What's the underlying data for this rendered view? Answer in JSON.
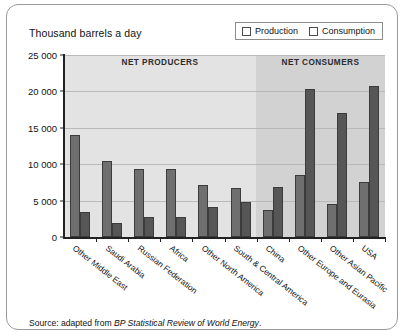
{
  "figure": {
    "title": "Thousand barrels a day",
    "source_prefix": "Source: adapted from ",
    "source_italic": "BP Statistical Review of World Energy",
    "source_suffix": "."
  },
  "legend": {
    "position": "top-right",
    "items": [
      {
        "label": "Production",
        "icon": "legend-swatch-icon",
        "color": "#6f6f6f"
      },
      {
        "label": "Consumption",
        "icon": "legend-swatch-icon",
        "color": "#565656"
      }
    ]
  },
  "bands": [
    {
      "label": "NET PRODUCERS",
      "color": "#e3e3e3"
    },
    {
      "label": "NET CONSUMERS",
      "color": "#d2d2d2"
    }
  ],
  "chart_data": {
    "type": "bar",
    "title": "Thousand barrels a day",
    "xlabel": "",
    "ylabel": "Thousand barrels a day",
    "ylim": [
      0,
      25000
    ],
    "yticks": [
      0,
      5000,
      10000,
      15000,
      20000,
      25000
    ],
    "ytick_labels": [
      "0",
      "5 000",
      "10 000",
      "15 000",
      "20 000",
      "25 000"
    ],
    "grid": true,
    "legend_position": "top-right",
    "categories": [
      "Other Middle East",
      "Saudi Arabia",
      "Russian Federation",
      "Africa",
      "Other North America",
      "South & Central America",
      "China",
      "Other Europe and Eurasia",
      "Other Asian Pacific",
      "USA"
    ],
    "series": [
      {
        "name": "Production",
        "color": "#6f6f6f",
        "values": [
          14000,
          10500,
          9400,
          9400,
          7100,
          6800,
          3700,
          8500,
          4600,
          7500
        ]
      },
      {
        "name": "Consumption",
        "color": "#565656",
        "values": [
          3500,
          1900,
          2700,
          2800,
          4100,
          4800,
          6900,
          20300,
          17000,
          20800
        ]
      }
    ],
    "annotations": [
      {
        "text": "NET PRODUCERS",
        "span": [
          "Other Middle East",
          "South & Central America"
        ]
      },
      {
        "text": "NET CONSUMERS",
        "span": [
          "China",
          "USA"
        ]
      }
    ]
  }
}
